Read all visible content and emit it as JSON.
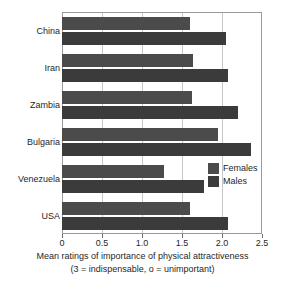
{
  "chart_data": {
    "type": "bar",
    "orientation": "horizontal",
    "title": "",
    "xlabel": "Mean ratings of importance of physical attractiveness",
    "xlabel_sub": "(3 = indispensable, o = unimportant)",
    "ylabel": "",
    "categories": [
      "China",
      "Iran",
      "Zambia",
      "Bulgaria",
      "Venezuela",
      "USA"
    ],
    "series": [
      {
        "name": "Females",
        "color": "#4b4b4b",
        "values": [
          1.6,
          1.64,
          1.62,
          1.95,
          1.27,
          1.6
        ]
      },
      {
        "name": "Males",
        "color": "#3b3b3b",
        "values": [
          2.05,
          2.07,
          2.2,
          2.36,
          1.77,
          2.08
        ]
      }
    ],
    "xlim": [
      0,
      2.5
    ],
    "xticks": [
      0,
      0.5,
      1.0,
      1.5,
      2.0,
      2.5
    ],
    "xtick_labels": [
      "0",
      "0.5",
      "1.0",
      "1.5",
      "2.0",
      "2.5"
    ],
    "grid": true,
    "grid_axis": "x",
    "legend_position": "middle-right",
    "legend_entries": [
      "Females",
      "Males"
    ]
  },
  "colors": {
    "females": "#4b4b4b",
    "males": "#3b3b3b",
    "gridline": "#c6c6c6",
    "frame": "#9a9a9a",
    "background": "#ffffff",
    "text": "#1f1f1f"
  }
}
